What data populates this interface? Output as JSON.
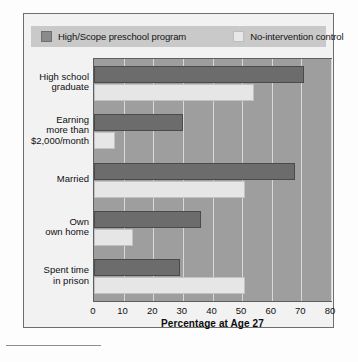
{
  "legend": {
    "series": [
      {
        "label": "High/Scope preschool program",
        "swatch": "dark",
        "color": "#8a8a8a"
      },
      {
        "label": "No-intervention control",
        "swatch": "light",
        "color": "#e8e8e8"
      }
    ]
  },
  "axis": {
    "title": "Percentage at Age 27",
    "ticks": [
      "0",
      "10",
      "20",
      "30",
      "40",
      "50",
      "60",
      "70",
      "80"
    ]
  },
  "categories_display": [
    [
      "High school",
      "graduate"
    ],
    [
      "Earning",
      "more than",
      "$2,000/month"
    ],
    [
      "Married"
    ],
    [
      "Own",
      "own home"
    ],
    [
      "Spent time",
      "in prison"
    ]
  ],
  "chart_data": {
    "type": "bar",
    "orientation": "horizontal",
    "title": "",
    "xlabel": "Percentage at Age 27",
    "ylabel": "",
    "xlim": [
      0,
      80
    ],
    "xticks": [
      0,
      10,
      20,
      30,
      40,
      50,
      60,
      70,
      80
    ],
    "grid": true,
    "legend_position": "top",
    "categories": [
      "High school graduate",
      "Earning more than $2,000/month",
      "Married",
      "Own own home",
      "Spent time in prison"
    ],
    "series": [
      {
        "name": "High/Scope preschool program",
        "color": "#6c6c6c",
        "values": [
          71,
          30,
          68,
          36,
          29
        ]
      },
      {
        "name": "No-intervention control",
        "color": "#e6e6e6",
        "values": [
          54,
          7,
          51,
          13,
          51
        ]
      }
    ]
  }
}
